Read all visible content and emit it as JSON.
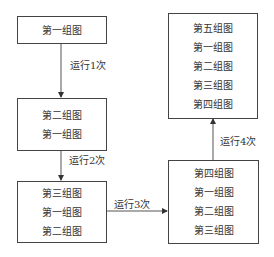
{
  "boxes": [
    {
      "id": "box1",
      "items": [
        "第一组图"
      ]
    },
    {
      "id": "box2",
      "items": [
        "第二组图",
        "第一组图"
      ]
    },
    {
      "id": "box3",
      "items": [
        "第三组图",
        "第一组图",
        "第二组图"
      ]
    },
    {
      "id": "box4",
      "items": [
        "第四组图",
        "第一组图",
        "第二组图",
        "第三组图"
      ]
    },
    {
      "id": "box5",
      "items": [
        "第五组图",
        "第一组图",
        "第二组图",
        "第三组图",
        "第四组图"
      ]
    }
  ],
  "arrows": [
    {
      "label": "运行1次"
    },
    {
      "label": "运行2次"
    },
    {
      "label": "运行3次"
    },
    {
      "label": "运行4次"
    }
  ]
}
